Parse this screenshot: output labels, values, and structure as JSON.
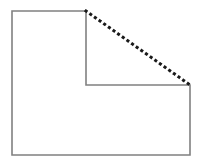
{
  "figure": {
    "canvas": {
      "width": 202,
      "height": 168,
      "background_color": "#ffffff"
    },
    "solid_outline": {
      "name": "l-shape-outline",
      "stroke_color": "#808080",
      "stroke_width": 1.6,
      "fill": "none",
      "style": "solid",
      "points": "12,11 86,11 86,85 190,85 190,155 12,155",
      "vertices": [
        {
          "label": "top-left",
          "x": 12,
          "y": 11
        },
        {
          "label": "top-right-of-upper-arm",
          "x": 86,
          "y": 11
        },
        {
          "label": "inner-step-top",
          "x": 86,
          "y": 85
        },
        {
          "label": "inner-step-right",
          "x": 190,
          "y": 85
        },
        {
          "label": "bottom-right",
          "x": 190,
          "y": 155
        },
        {
          "label": "bottom-left",
          "x": 12,
          "y": 155
        }
      ],
      "closed": true
    },
    "dotted_diagonal": {
      "name": "dotted-hypotenuse",
      "stroke_color": "#1a1a1a",
      "stroke_width": 3,
      "style": "dotted",
      "dash_pattern": "0.1 5.6",
      "linecap": "square",
      "start": {
        "x": 86,
        "y": 11
      },
      "end": {
        "x": 190,
        "y": 85
      }
    }
  }
}
